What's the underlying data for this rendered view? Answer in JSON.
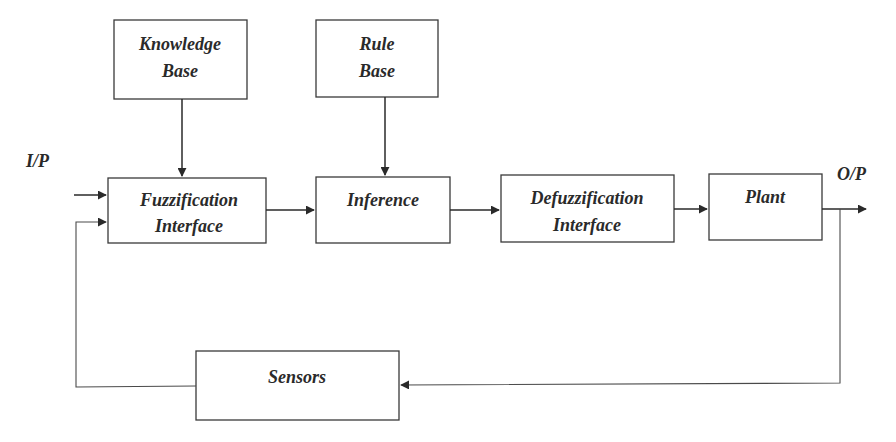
{
  "diagram": {
    "input_label": "I/P",
    "output_label": "O/P",
    "blocks": {
      "knowledge_base": {
        "line1": "Knowledge",
        "line2": "Base"
      },
      "rule_base": {
        "line1": "Rule",
        "line2": "Base"
      },
      "fuzzification": {
        "line1": "Fuzzification",
        "line2": "Interface"
      },
      "inference": {
        "line1": "Inference"
      },
      "defuzzification": {
        "line1": "Defuzzification",
        "line2": "Interface"
      },
      "plant": {
        "line1": "Plant"
      },
      "sensors": {
        "line1": "Sensors"
      }
    },
    "connections": [
      {
        "from": "Knowledge Base",
        "to": "Fuzzification Interface"
      },
      {
        "from": "Rule Base",
        "to": "Inference"
      },
      {
        "from": "I/P",
        "to": "Fuzzification Interface"
      },
      {
        "from": "Fuzzification Interface",
        "to": "Inference"
      },
      {
        "from": "Inference",
        "to": "Defuzzification Interface"
      },
      {
        "from": "Defuzzification Interface",
        "to": "Plant"
      },
      {
        "from": "Plant",
        "to": "O/P"
      },
      {
        "from": "O/P",
        "to": "Sensors"
      },
      {
        "from": "Sensors",
        "to": "Fuzzification Interface"
      }
    ]
  }
}
